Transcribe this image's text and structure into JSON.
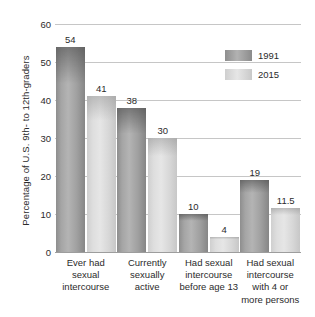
{
  "chart_data": {
    "type": "bar",
    "title": "",
    "subtitle": "",
    "xlabel": "",
    "ylabel": "Percentage of U.S. 9th- to 12th-graders",
    "ylim": [
      0,
      60
    ],
    "ytick_labels": [
      "0",
      "10",
      "20",
      "30",
      "40",
      "50",
      "60"
    ],
    "ytick_values": [
      0,
      10,
      20,
      30,
      40,
      50,
      60
    ],
    "grid": "horizontal",
    "legend_position": "top-right",
    "categories": [
      "Ever had sexual intercourse",
      "Currently sexually active",
      "Had sexual intercourse before age 13",
      "Had sexual intercourse with 4 or more persons"
    ],
    "category_lines": [
      [
        "Ever had",
        "sexual",
        "intercourse"
      ],
      [
        "Currently",
        "sexually",
        "active"
      ],
      [
        "Had sexual",
        "intercourse",
        "before age 13"
      ],
      [
        "Had sexual",
        "intercourse",
        "with 4 or",
        "more persons"
      ]
    ],
    "series": [
      {
        "name": "1991",
        "color": "#a5a5a5",
        "values": [
          54,
          38,
          10,
          19
        ],
        "value_labels": [
          "54",
          "38",
          "10",
          "19"
        ]
      },
      {
        "name": "2015",
        "color": "#dedede",
        "values": [
          41,
          30,
          4,
          11.5
        ],
        "value_labels": [
          "41",
          "30",
          "4",
          "11.5"
        ]
      }
    ]
  },
  "legend": {
    "items": [
      {
        "label": "1991"
      },
      {
        "label": "2015"
      }
    ]
  }
}
